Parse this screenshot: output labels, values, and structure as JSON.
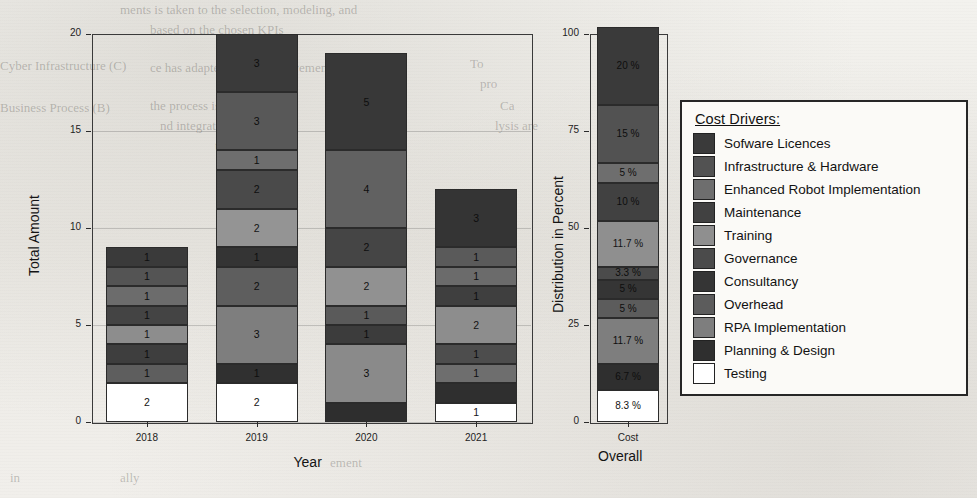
{
  "figure": {
    "background_color": "#efeeea",
    "ghost_texts": [
      {
        "text": "ments is taken to the selection, modeling, and",
        "x": 120,
        "y": 2,
        "size": 13
      },
      {
        "text": "based on the chosen KPIs",
        "x": 150,
        "y": 22,
        "size": 13
      },
      {
        "text": "Cyber Infrastructure (C)",
        "x": 0,
        "y": 58,
        "size": 13
      },
      {
        "text": "To",
        "x": 470,
        "y": 56,
        "size": 13
      },
      {
        "text": "ce has adapted to the improvement",
        "x": 150,
        "y": 60,
        "size": 13
      },
      {
        "text": "pro",
        "x": 480,
        "y": 76,
        "size": 13
      },
      {
        "text": "Business Process (B)",
        "x": 0,
        "y": 100,
        "size": 13
      },
      {
        "text": "the process is enhanced",
        "x": 150,
        "y": 98,
        "size": 13
      },
      {
        "text": "Ca",
        "x": 500,
        "y": 98,
        "size": 13
      },
      {
        "text": "nd integrated data",
        "x": 160,
        "y": 118,
        "size": 13
      },
      {
        "text": "lysis are",
        "x": 495,
        "y": 118,
        "size": 13
      },
      {
        "text": "th",
        "x": 215,
        "y": 138,
        "size": 13
      },
      {
        "text": "ement",
        "x": 330,
        "y": 455,
        "size": 13
      },
      {
        "text": "ally",
        "x": 120,
        "y": 470,
        "size": 13
      },
      {
        "text": "in",
        "x": 10,
        "y": 470,
        "size": 13
      }
    ]
  },
  "left_panel": {
    "y_axis": {
      "title": "Total Amount",
      "ticks": [
        "0",
        "5",
        "10",
        "15",
        "20"
      ],
      "min": 0,
      "max": 20
    },
    "x_axis": {
      "title": "Year",
      "ticks": [
        "2018",
        "2019",
        "2020",
        "2021"
      ]
    }
  },
  "right_panel": {
    "y_axis": {
      "title": "Distribution in Percent",
      "ticks": [
        "0",
        "25",
        "50",
        "75",
        "100"
      ],
      "min": 0,
      "max": 100
    },
    "x_axis": {
      "title": "Overall",
      "ticks": [
        "Cost"
      ]
    }
  },
  "legend": {
    "title": "Cost Drivers:",
    "items": [
      {
        "label": "Sofware Licences",
        "color": "#3a3a3a"
      },
      {
        "label": "Infrastructure & Hardware",
        "color": "#525252"
      },
      {
        "label": "Enhanced Robot Implementation",
        "color": "#6e6e6e"
      },
      {
        "label": "Maintenance",
        "color": "#414141"
      },
      {
        "label": "Training",
        "color": "#8f8f8f"
      },
      {
        "label": "Governance",
        "color": "#4b4b4b"
      },
      {
        "label": "Consultancy",
        "color": "#353535"
      },
      {
        "label": "Overhead",
        "color": "#5c5c5c"
      },
      {
        "label": "RPA Implementation",
        "color": "#7e7e7e"
      },
      {
        "label": "Planning & Design",
        "color": "#2f2f2f"
      },
      {
        "label": "Testing",
        "color": "#ffffff"
      }
    ]
  },
  "chart_data": {
    "type": "bar",
    "title": "",
    "subtitle": "",
    "stacked": true,
    "legend_position": "right",
    "grid": true,
    "panels": [
      {
        "name": "Total Amount by Year",
        "xlabel": "Year",
        "ylabel": "Total Amount",
        "ylim": [
          0,
          20
        ],
        "yticks": [
          0,
          5,
          10,
          15,
          20
        ],
        "categories": [
          "2018",
          "2019",
          "2020",
          "2021"
        ],
        "series": [
          {
            "name": "Sofware Licences",
            "color": "#3a3a3a",
            "values": [
              1,
              3,
              5,
              3
            ]
          },
          {
            "name": "Infrastructure & Hardware",
            "color": "#525252",
            "values": [
              1,
              3,
              4,
              1
            ]
          },
          {
            "name": "Enhanced Robot Implementation",
            "color": "#6e6e6e",
            "values": [
              1,
              1,
              2,
              1
            ]
          },
          {
            "name": "Maintenance",
            "color": "#414141",
            "values": [
              1,
              2,
              2,
              1
            ]
          },
          {
            "name": "Training",
            "color": "#8f8f8f",
            "values": [
              1,
              2,
              1,
              2
            ]
          },
          {
            "name": "Governance",
            "color": "#4b4b4b",
            "values": [
              1,
              1,
              1,
              1
            ]
          },
          {
            "name": "Consultancy",
            "color": "#353535",
            "values": [
              0,
              2,
              0,
              1
            ]
          },
          {
            "name": "Overhead",
            "color": "#5c5c5c",
            "values": [
              1,
              3,
              3,
              1
            ]
          },
          {
            "name": "RPA Implementation",
            "color": "#7e7e7e",
            "values": [
              0,
              1,
              1,
              0
            ]
          },
          {
            "name": "Planning & Design",
            "color": "#2f2f2f",
            "values": [
              0,
              0,
              0,
              0
            ]
          },
          {
            "name": "Testing",
            "color": "#ffffff",
            "values": [
              2,
              2,
              0,
              1
            ]
          }
        ],
        "totals": [
          9,
          20,
          19,
          12
        ]
      },
      {
        "name": "Overall Cost Distribution",
        "xlabel": "Overall",
        "ylabel": "Distribution in Percent",
        "ylim": [
          0,
          100
        ],
        "yticks": [
          0,
          25,
          50,
          75,
          100
        ],
        "categories": [
          "Cost"
        ],
        "slices": [
          {
            "name": "Sofware Licences",
            "color": "#3a3a3a",
            "value": 20.0,
            "label": "20 %"
          },
          {
            "name": "Infrastructure & Hardware",
            "color": "#525252",
            "value": 15.0,
            "label": "15 %"
          },
          {
            "name": "Enhanced Robot Implementation",
            "color": "#6e6e6e",
            "value": 5.0,
            "label": "5 %"
          },
          {
            "name": "Maintenance",
            "color": "#414141",
            "value": 10.0,
            "label": "10 %"
          },
          {
            "name": "Training",
            "color": "#8f8f8f",
            "value": 11.7,
            "label": "11.7 %"
          },
          {
            "name": "Governance",
            "color": "#4b4b4b",
            "value": 3.3,
            "label": "3.3 %"
          },
          {
            "name": "Consultancy",
            "color": "#353535",
            "value": 5.0,
            "label": "5 %"
          },
          {
            "name": "Overhead",
            "color": "#5c5c5c",
            "value": 5.0,
            "label": "5 %"
          },
          {
            "name": "RPA Implementation",
            "color": "#7e7e7e",
            "value": 11.7,
            "label": "11.7 %"
          },
          {
            "name": "Planning & Design",
            "color": "#2f2f2f",
            "value": 6.7,
            "label": "6.7 %"
          },
          {
            "name": "Testing",
            "color": "#ffffff",
            "value": 8.3,
            "label": "8.3 %"
          }
        ]
      }
    ]
  },
  "bar_segments": {
    "2018": [
      {
        "value": 1,
        "label": "1",
        "color": "#3a3a3a"
      },
      {
        "value": 1,
        "label": "1",
        "color": "#545454"
      },
      {
        "value": 1,
        "label": "1",
        "color": "#6c6c6c"
      },
      {
        "value": 1,
        "label": "1",
        "color": "#444444"
      },
      {
        "value": 1,
        "label": "1",
        "color": "#8d8d8d"
      },
      {
        "value": 1,
        "label": "1",
        "color": "#3e3e3e"
      },
      {
        "value": 1,
        "label": "1",
        "color": "#5e5e5e"
      },
      {
        "value": 2,
        "label": "2",
        "color": "#ffffff"
      }
    ],
    "2019": [
      {
        "value": 3,
        "label": "3",
        "color": "#3a3a3a"
      },
      {
        "value": 3,
        "label": "3",
        "color": "#585858"
      },
      {
        "value": 1,
        "label": "1",
        "color": "#6e6e6e"
      },
      {
        "value": 2,
        "label": "2",
        "color": "#4a4a4a"
      },
      {
        "value": 2,
        "label": "2",
        "color": "#949494"
      },
      {
        "value": 1,
        "label": "1",
        "color": "#343434"
      },
      {
        "value": 2,
        "label": "2",
        "color": "#5e5e5e"
      },
      {
        "value": 3,
        "label": "3",
        "color": "#7e7e7e"
      },
      {
        "value": 1,
        "label": "1",
        "color": "#303030"
      },
      {
        "value": 2,
        "label": "2",
        "color": "#ffffff"
      }
    ],
    "2020": [
      {
        "value": 5,
        "label": "5",
        "color": "#383838"
      },
      {
        "value": 4,
        "label": "4",
        "color": "#616161"
      },
      {
        "value": 2,
        "label": "2",
        "color": "#454545"
      },
      {
        "value": 2,
        "label": "2",
        "color": "#919191"
      },
      {
        "value": 1,
        "label": "1",
        "color": "#5a5a5a"
      },
      {
        "value": 1,
        "label": "1",
        "color": "#3c3c3c"
      },
      {
        "value": 3,
        "label": "3",
        "color": "#8a8a8a"
      },
      {
        "value": 1,
        "label": "",
        "color": "#2e2e2e"
      }
    ],
    "2021": [
      {
        "value": 3,
        "label": "3",
        "color": "#343434"
      },
      {
        "value": 1,
        "label": "1",
        "color": "#5a5a5a"
      },
      {
        "value": 1,
        "label": "1",
        "color": "#6b6b6b"
      },
      {
        "value": 1,
        "label": "1",
        "color": "#3f3f3f"
      },
      {
        "value": 2,
        "label": "2",
        "color": "#8d8d8d"
      },
      {
        "value": 1,
        "label": "1",
        "color": "#4d4d4d"
      },
      {
        "value": 1,
        "label": "1",
        "color": "#6e6e6e"
      },
      {
        "value": 1,
        "label": "",
        "color": "#2f2f2f"
      },
      {
        "value": 1,
        "label": "1",
        "color": "#ffffff"
      }
    ]
  }
}
